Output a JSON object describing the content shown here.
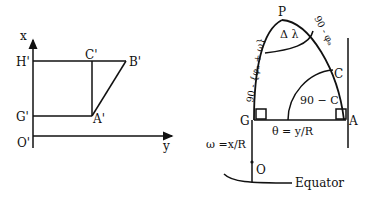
{
  "left_diagram": {
    "axis_x_label": "x",
    "axis_y_label": "y",
    "origin_label": "O'",
    "points": {
      "H": "H'",
      "G": "G'",
      "C": "C'",
      "B": "B'",
      "A": "A'"
    }
  },
  "right_diagram": {
    "pole_label": "P",
    "delta_lambda": "Δ λ",
    "left_arc_label": "90 - {φₐ + ω}",
    "right_arc_label": "90 - φₐ",
    "point_C": "C",
    "angle_label": "90 − C",
    "point_G": "G",
    "point_A": "A",
    "theta_label": "θ = y/R",
    "omega_label": "ω =x/R",
    "point_O": "O",
    "equator_label": "Equator"
  }
}
